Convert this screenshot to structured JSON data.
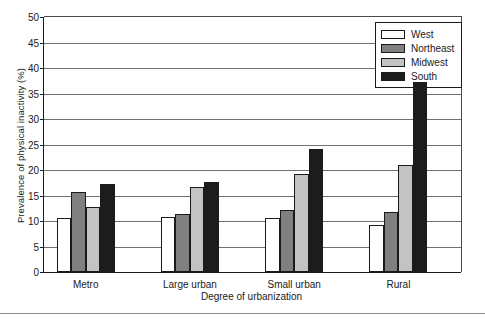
{
  "chart_data": {
    "type": "bar",
    "title": "",
    "xlabel": "Degree of urbanization",
    "ylabel": "Prevalence of physical inactivity (%)",
    "categories": [
      "Metro",
      "Large urban",
      "Small urban",
      "Rural"
    ],
    "series": [
      {
        "name": "West",
        "color": "#ffffff",
        "values": [
          10.5,
          10.7,
          10.6,
          9.2
        ]
      },
      {
        "name": "Northeast",
        "color": "#808080",
        "values": [
          15.7,
          11.3,
          12.1,
          11.8
        ]
      },
      {
        "name": "Midwest",
        "color": "#c3c3c3",
        "values": [
          12.8,
          16.7,
          19.3,
          21.0
        ]
      },
      {
        "name": "South",
        "color": "#1c1c1c",
        "values": [
          17.2,
          17.6,
          24.1,
          37.2
        ]
      }
    ],
    "ylim": [
      0,
      50
    ],
    "ytick_step": 5,
    "yticks": [
      "0",
      "5",
      "10",
      "15",
      "20",
      "25",
      "30",
      "35",
      "40",
      "45",
      "50"
    ],
    "grid": true,
    "legend_position": "top-right"
  }
}
